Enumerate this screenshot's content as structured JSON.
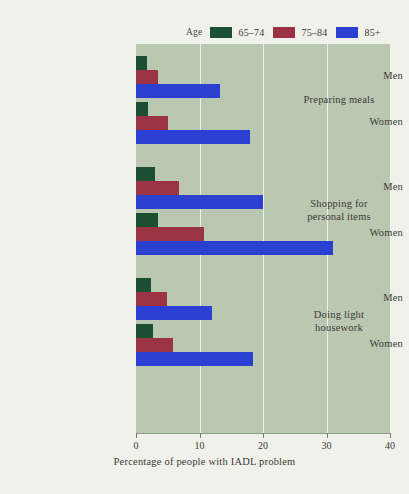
{
  "chart_data": {
    "type": "bar",
    "orientation": "horizontal",
    "title": "",
    "xlabel": "Percentage of people with IADL problem",
    "ylabel": "",
    "xlim": [
      0,
      40
    ],
    "xticks": [
      0,
      10,
      20,
      30,
      40
    ],
    "xtick_labels": [
      "0",
      "10",
      "20",
      "30",
      "40"
    ],
    "grid": true,
    "gridlines_at": [
      10,
      20,
      30
    ],
    "legend": {
      "title": "Age",
      "position": "top",
      "entries": [
        {
          "label": "65–74",
          "color": "#1d4f35"
        },
        {
          "label": "75–84",
          "color": "#9b3344"
        },
        {
          "label": "85+",
          "color": "#2b3fd0"
        }
      ]
    },
    "series": [
      {
        "name": "65–74",
        "color": "#1d4f35",
        "values": [
          1.7,
          1.9,
          3.0,
          3.4,
          2.3,
          2.6
        ]
      },
      {
        "name": "75–84",
        "color": "#9b3344",
        "values": [
          3.5,
          5.0,
          6.7,
          10.7,
          4.9,
          5.8
        ]
      },
      {
        "name": "85+",
        "color": "#2b3fd0",
        "values": [
          13.3,
          18.0,
          20.0,
          31.0,
          12.0,
          18.5
        ]
      }
    ],
    "categories": [
      "Preparing meals – Men",
      "Preparing meals – Women",
      "Shopping for personal items – Men",
      "Shopping for personal items – Women",
      "Doing light housework – Men",
      "Doing light housework – Women"
    ],
    "groups": [
      {
        "label_line1": "Preparing meals",
        "label_line2": "",
        "subgroups": [
          {
            "label": "Men",
            "values": [
              1.7,
              3.5,
              13.3
            ]
          },
          {
            "label": "Women",
            "values": [
              1.9,
              5.0,
              18.0
            ]
          }
        ]
      },
      {
        "label_line1": "Shopping for",
        "label_line2": "personal items",
        "subgroups": [
          {
            "label": "Men",
            "values": [
              3.0,
              6.7,
              20.0
            ]
          },
          {
            "label": "Women",
            "values": [
              3.4,
              10.7,
              31.0
            ]
          }
        ]
      },
      {
        "label_line1": "Doing light",
        "label_line2": "housework",
        "subgroups": [
          {
            "label": "Men",
            "values": [
              2.3,
              4.9,
              12.0
            ]
          },
          {
            "label": "Women",
            "values": [
              2.6,
              5.8,
              18.5
            ]
          }
        ]
      }
    ]
  },
  "colors": {
    "page_background": "#f1f1eb",
    "plot_background": "#bac7b1",
    "gridline": "#edf0ea",
    "axis": "#8d9a86",
    "text": "#3a3a38"
  }
}
